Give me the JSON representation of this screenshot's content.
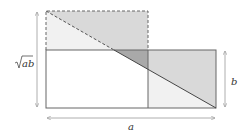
{
  "diagram": {
    "labels": {
      "sqrt_ab": "√ab",
      "sqrt_ab_radicand": "ab",
      "b": "b",
      "a": "a"
    },
    "colors": {
      "line": "#666666",
      "arrow": "#999999",
      "light_fill": "#f1f1f1",
      "medium_fill": "#d9d9d9",
      "dark_fill": "#a9a9a9",
      "background": "#ffffff"
    },
    "shapes": {
      "solid_rectangle": {
        "x": 46,
        "y": 50,
        "width": 170,
        "height": 58
      },
      "dashed_square": {
        "x": 46,
        "y": 11,
        "width": 102,
        "height": 97
      },
      "diagonal": {
        "x1": 46,
        "y1": 11,
        "x2": 216,
        "y2": 108
      },
      "divider_x": 148
    }
  }
}
